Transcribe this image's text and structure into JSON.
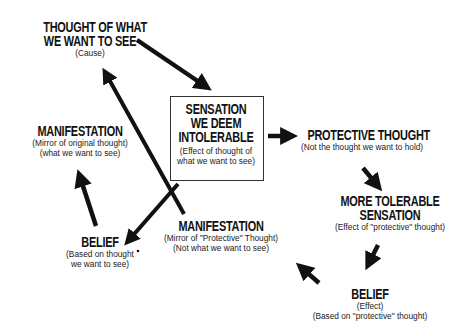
{
  "diagram": {
    "nodes": {
      "thought_cause": {
        "title_lines": [
          "THOUGHT OF WHAT",
          "WE WANT TO SEE"
        ],
        "sub_lines": [
          "(Cause)"
        ]
      },
      "sensation_intolerable": {
        "title_lines": [
          "SENSATION",
          "WE DEEM",
          "INTOLERABLE"
        ],
        "sub_lines": [
          "(Effect of thought of",
          "what we want to see)"
        ]
      },
      "protective_thought": {
        "title_lines": [
          "PROTECTIVE THOUGHT"
        ],
        "sub_lines": [
          "(Not the thought we want to hold)"
        ]
      },
      "more_tolerable": {
        "title_lines": [
          "MORE TOLERABLE",
          "SENSATION"
        ],
        "sub_lines": [
          "(Effect of \"protective\" thought)"
        ]
      },
      "belief_protective": {
        "title_lines": [
          "BELIEF"
        ],
        "sub_lines": [
          "(Effect)",
          "(Based on \"protective\" thought)"
        ]
      },
      "manifestation_protective": {
        "title_lines": [
          "MANIFESTATION"
        ],
        "sub_lines": [
          "(Mirror of \"Protective\" Thought)",
          "(Not what we want to see)"
        ]
      },
      "belief_wanted": {
        "title_lines": [
          "BELIEF"
        ],
        "sub_lines": [
          "(Based on thought",
          "we want to see)"
        ]
      },
      "manifestation_original": {
        "title_lines": [
          "MANIFESTATION"
        ],
        "sub_lines": [
          "(Mirror of original thought)",
          "(what we want to see)"
        ]
      }
    },
    "edges": [
      {
        "from": "thought_cause",
        "to": "sensation_intolerable"
      },
      {
        "from": "sensation_intolerable",
        "to": "protective_thought"
      },
      {
        "from": "protective_thought",
        "to": "more_tolerable"
      },
      {
        "from": "more_tolerable",
        "to": "belief_protective"
      },
      {
        "from": "belief_protective",
        "to": "manifestation_protective"
      },
      {
        "from": "manifestation_protective",
        "to": "thought_cause"
      },
      {
        "from": "sensation_intolerable",
        "to": "belief_wanted"
      },
      {
        "from": "belief_wanted",
        "to": "manifestation_original"
      }
    ],
    "colors": {
      "ink": "#111111",
      "background": "#ffffff",
      "box_border": "#333333"
    }
  }
}
